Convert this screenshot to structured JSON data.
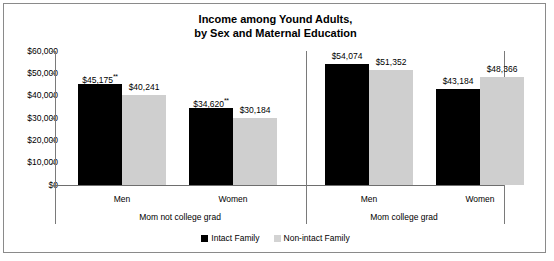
{
  "title": {
    "line1": "Income among Yound Adults,",
    "line2": "by Sex and Maternal Education"
  },
  "legend": {
    "items": [
      {
        "label": "Intact Family",
        "color": "#000000"
      },
      {
        "label": "Non-intact Family",
        "color": "#d3d3d3"
      }
    ]
  },
  "axis": {
    "yticks": [
      "$60,000",
      "$50,000",
      "$40,000",
      "$30,000",
      "$20,000",
      "$10,000",
      "$0"
    ]
  },
  "groups": [
    {
      "label": "Mom not college grad",
      "categories": [
        "Men",
        "Women"
      ]
    },
    {
      "label": "Mom college grad",
      "categories": [
        "Men",
        "Women"
      ]
    }
  ],
  "bars": [
    {
      "label": "$45,175",
      "mark": "**",
      "value": 45175,
      "series": "Intact Family"
    },
    {
      "label": "$40,241",
      "mark": "",
      "value": 40241,
      "series": "Non-intact Family"
    },
    {
      "label": "$34,620",
      "mark": "**",
      "value": 34620,
      "series": "Intact Family"
    },
    {
      "label": "$30,184",
      "mark": "",
      "value": 30184,
      "series": "Non-intact Family"
    },
    {
      "label": "$54,074",
      "mark": "",
      "value": 54074,
      "series": "Intact Family"
    },
    {
      "label": "$51,352",
      "mark": "",
      "value": 51352,
      "series": "Non-intact Family"
    },
    {
      "label": "$43,184",
      "mark": "",
      "value": 43184,
      "series": "Intact Family"
    },
    {
      "label": "$48,366",
      "mark": "",
      "value": 48366,
      "series": "Non-intact Family"
    }
  ],
  "chart_data": {
    "type": "bar",
    "title": "Income among Yound Adults, by Sex and Maternal Education",
    "xlabel": "",
    "ylabel": "",
    "ylim": [
      0,
      60000
    ],
    "ytick_values": [
      0,
      10000,
      20000,
      30000,
      40000,
      50000,
      60000
    ],
    "ytick_labels": [
      "$0",
      "$10,000",
      "$20,000",
      "$30,000",
      "$40,000",
      "$50,000",
      "$60,000"
    ],
    "grid": false,
    "legend_position": "bottom",
    "group_labels": [
      "Mom not college grad",
      "Mom college grad"
    ],
    "categories": [
      "Mom not college grad / Men",
      "Mom not college grad / Women",
      "Mom college grad / Men",
      "Mom college grad / Women"
    ],
    "series": [
      {
        "name": "Intact Family",
        "color": "#000000",
        "values": [
          45175,
          34620,
          54074,
          43184
        ]
      },
      {
        "name": "Non-intact Family",
        "color": "#cfcfcf",
        "values": [
          40241,
          30184,
          51352,
          48366
        ]
      }
    ],
    "data_labels": [
      [
        "$45,175**",
        "$34,620**",
        "$54,074",
        "$43,184"
      ],
      [
        "$40,241",
        "$30,184",
        "$51,352",
        "$48,366"
      ]
    ],
    "annotations": [
      "** denotes statistical significance marker on Intact Family bars for Mom not college grad group"
    ]
  }
}
